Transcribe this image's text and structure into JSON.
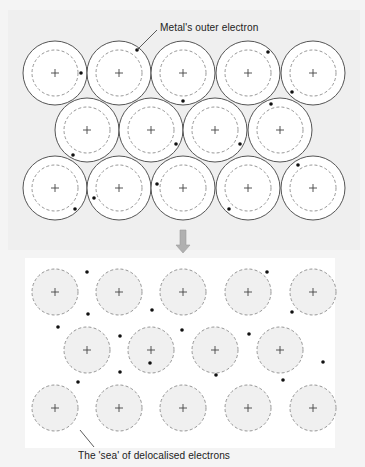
{
  "figure": {
    "top_label": "Metal's outer electron",
    "bottom_label": "The 'sea' of delocalised electrons",
    "colors": {
      "top_background": "#efefef",
      "bottom_background": "#ffffff",
      "outer_background": "#f4f4f4",
      "atom_fill": "#ffffff",
      "ion_fill": "#f0f0f0",
      "outline": "#555555",
      "dashed": "#8a8a8a",
      "electron": "#111111",
      "arrow": "#b0b0b0"
    },
    "top_panel": {
      "description": "Metal atoms each with outer electron",
      "outer_radius": 32,
      "inner_radius": 23,
      "atoms": [
        {
          "x": 55,
          "y": 73,
          "e": [
            81,
            73
          ]
        },
        {
          "x": 119,
          "y": 73,
          "e": [
            137,
            50
          ]
        },
        {
          "x": 183,
          "y": 73,
          "e": [
            183,
            101
          ]
        },
        {
          "x": 248,
          "y": 73,
          "e": [
            268,
            52
          ]
        },
        {
          "x": 313,
          "y": 73,
          "e": [
            292,
            92
          ]
        },
        {
          "x": 87,
          "y": 130,
          "e": [
            73,
            155
          ]
        },
        {
          "x": 151,
          "y": 130,
          "e": [
            176,
            144
          ]
        },
        {
          "x": 215,
          "y": 130,
          "e": [
            240,
            144
          ]
        },
        {
          "x": 280,
          "y": 130,
          "e": [
            271,
            104
          ]
        },
        {
          "x": 55,
          "y": 188,
          "e": [
            75,
            209
          ]
        },
        {
          "x": 119,
          "y": 188,
          "e": [
            94,
            198
          ]
        },
        {
          "x": 183,
          "y": 188,
          "e": [
            157,
            184
          ]
        },
        {
          "x": 248,
          "y": 188,
          "e": [
            229,
            209
          ]
        },
        {
          "x": 313,
          "y": 188,
          "e": [
            298,
            165
          ]
        }
      ]
    },
    "bottom_panel": {
      "description": "Positive ions in a sea of delocalised electrons",
      "ion_radius": 23,
      "ions": [
        {
          "x": 55,
          "y": 292
        },
        {
          "x": 119,
          "y": 292
        },
        {
          "x": 183,
          "y": 292
        },
        {
          "x": 248,
          "y": 292
        },
        {
          "x": 313,
          "y": 292
        },
        {
          "x": 87,
          "y": 350
        },
        {
          "x": 151,
          "y": 350
        },
        {
          "x": 215,
          "y": 350
        },
        {
          "x": 280,
          "y": 350
        },
        {
          "x": 55,
          "y": 408
        },
        {
          "x": 119,
          "y": 408
        },
        {
          "x": 183,
          "y": 408
        },
        {
          "x": 248,
          "y": 408
        },
        {
          "x": 313,
          "y": 408
        }
      ],
      "electrons": [
        [
          87,
          272
        ],
        [
          267,
          272
        ],
        [
          88,
          314
        ],
        [
          152,
          310
        ],
        [
          292,
          312
        ],
        [
          58,
          327
        ],
        [
          182,
          330
        ],
        [
          249,
          334
        ],
        [
          120,
          336
        ],
        [
          323,
          362
        ],
        [
          78,
          382
        ],
        [
          120,
          372
        ],
        [
          150,
          363
        ],
        [
          216,
          375
        ],
        [
          283,
          380
        ]
      ]
    },
    "arrow": {
      "x": 183,
      "y1": 230,
      "y2": 253
    }
  }
}
